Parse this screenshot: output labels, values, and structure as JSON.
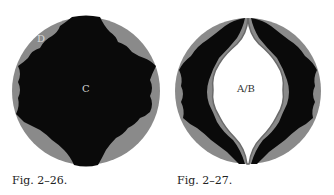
{
  "figures": [
    {
      "caption": "Fig. 2–26.",
      "labels": {
        "outer": "D",
        "center": "C"
      }
    },
    {
      "caption": "Fig. 2–27.",
      "labels": {
        "center": "A/B"
      }
    }
  ],
  "colors": {
    "black": "#0a0a0a",
    "gray": "#8a8a8a",
    "white": "#ffffff",
    "label_light": "#d8d8d8",
    "label_dark": "#333333"
  }
}
